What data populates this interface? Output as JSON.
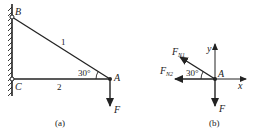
{
  "figure_a": {
    "caption": "(a)",
    "labels": {
      "B": "B",
      "C": "C",
      "A": "A",
      "rod1": "1",
      "rod2": "2",
      "angle": "30°",
      "force": "F"
    }
  },
  "figure_b": {
    "caption": "(b)",
    "labels": {
      "A": "A",
      "x": "x",
      "y": "y",
      "angle": "30°",
      "force": "F",
      "fn1_main": "F",
      "fn1_sub": "N1",
      "fn2_main": "F",
      "fn2_sub": "N2"
    }
  },
  "colors": {
    "ink": "#222222",
    "background": "#ffffff"
  }
}
